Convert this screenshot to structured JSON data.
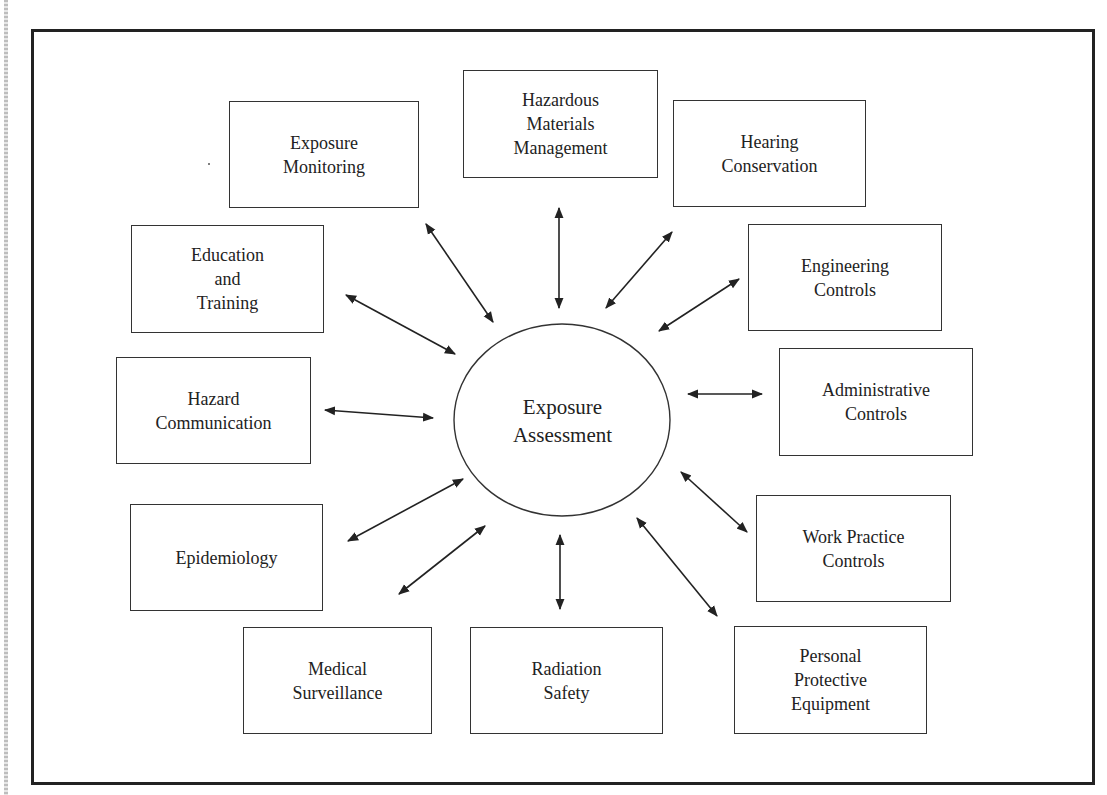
{
  "diagram": {
    "type": "hub-and-spoke",
    "center": {
      "lines": [
        "Exposure",
        "Assessment"
      ]
    },
    "nodes": [
      {
        "id": "exposure-monitoring",
        "lines": [
          "Exposure",
          "Monitoring"
        ]
      },
      {
        "id": "hazardous-materials-management",
        "lines": [
          "Hazardous",
          "Materials",
          "Management"
        ]
      },
      {
        "id": "hearing-conservation",
        "lines": [
          "Hearing",
          "Conservation"
        ]
      },
      {
        "id": "engineering-controls",
        "lines": [
          "Engineering",
          "Controls"
        ]
      },
      {
        "id": "administrative-controls",
        "lines": [
          "Administrative",
          "Controls"
        ]
      },
      {
        "id": "work-practice-controls",
        "lines": [
          "Work Practice",
          "Controls"
        ]
      },
      {
        "id": "personal-protective-equipment",
        "lines": [
          "Personal",
          "Protective",
          "Equipment"
        ]
      },
      {
        "id": "radiation-safety",
        "lines": [
          "Radiation",
          "Safety"
        ]
      },
      {
        "id": "medical-surveillance",
        "lines": [
          "Medical",
          "Surveillance"
        ]
      },
      {
        "id": "epidemiology",
        "lines": [
          "Epidemiology"
        ]
      },
      {
        "id": "hazard-communication",
        "lines": [
          "Hazard",
          "Communication"
        ]
      },
      {
        "id": "education-and-training",
        "lines": [
          "Education",
          "and",
          "Training"
        ]
      }
    ],
    "connections": "bidirectional arrows between each node and the center",
    "colors": {
      "stroke": "#333333",
      "background": "#ffffff",
      "frame": "#222222"
    }
  }
}
